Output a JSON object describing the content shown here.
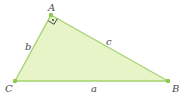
{
  "diagram": {
    "fill_color": "#e6f4c8",
    "stroke_color": "#9fd36a",
    "vertex_color": "#8cc850",
    "vertices": {
      "A": {
        "label": "A",
        "right_angle": true
      },
      "B": {
        "label": "B"
      },
      "C": {
        "label": "C"
      }
    },
    "sides": {
      "a": {
        "label": "a",
        "between": "B-C"
      },
      "b": {
        "label": "b",
        "between": "A-C"
      },
      "c": {
        "label": "c",
        "between": "A-B"
      }
    },
    "right_angle_mark": "dot-in-square"
  }
}
